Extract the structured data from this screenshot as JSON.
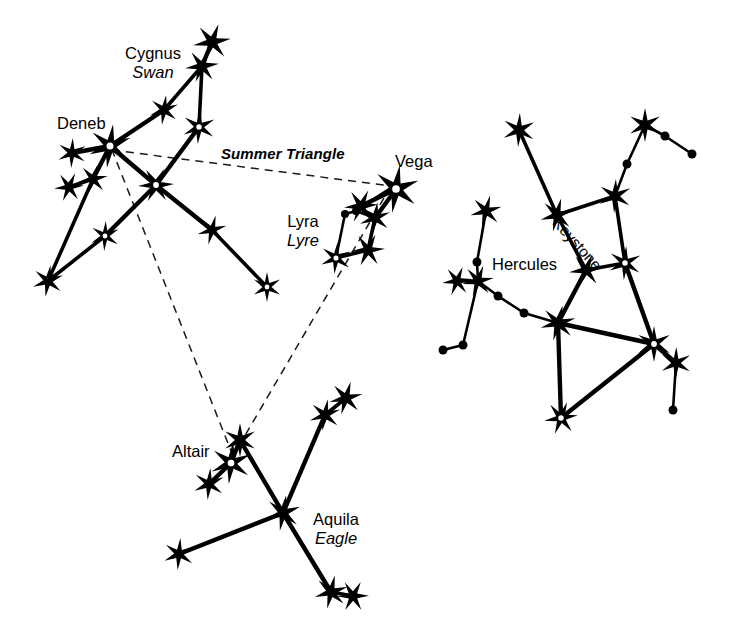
{
  "figure": {
    "background_color": "#ffffff",
    "ink_color": "#000000",
    "width": 735,
    "height": 640
  },
  "labels": {
    "cygnus_name": "Cygnus",
    "cygnus_common": "Swan",
    "deneb": "Deneb",
    "summer_triangle": "Summer Triangle",
    "vega": "Vega",
    "lyra_name": "Lyra",
    "lyra_common": "Lyre",
    "altair": "Altair",
    "aquila_name": "Aquila",
    "aquila_common": "Eagle",
    "hercules": "Hercules",
    "keystone": "Keystone"
  },
  "chart_data": {
    "type": "scatter",
    "xlabel": "",
    "ylabel": "",
    "xlim": [
      0,
      735
    ],
    "ylim": [
      0,
      640
    ],
    "grid": false,
    "legend": "none",
    "marker_types": [
      "star",
      "star-open",
      "dot"
    ],
    "constellations": [
      {
        "name": "Cygnus",
        "common_name": "Swan",
        "label_position": [
          150,
          55
        ],
        "bright_star": "Deneb",
        "stars": [
          {
            "id": "cyg-tip-top",
            "x": 212,
            "y": 42,
            "type": "star",
            "size": 19
          },
          {
            "id": "cyg-tip-2",
            "x": 202,
            "y": 66,
            "type": "star",
            "size": 17
          },
          {
            "id": "cyg-wing-r1",
            "x": 199,
            "y": 127,
            "type": "star-open",
            "size": 17
          },
          {
            "id": "cyg-mid-upper",
            "x": 164,
            "y": 110,
            "type": "star",
            "size": 15
          },
          {
            "id": "deneb",
            "x": 110,
            "y": 146,
            "type": "star-open",
            "size": 22
          },
          {
            "id": "cyg-wing-l1",
            "x": 72,
            "y": 153,
            "type": "star",
            "size": 15
          },
          {
            "id": "cyg-wing-l2",
            "x": 93,
            "y": 179,
            "type": "star",
            "size": 15
          },
          {
            "id": "cyg-wing-l3",
            "x": 69,
            "y": 187,
            "type": "star",
            "size": 15
          },
          {
            "id": "cyg-center",
            "x": 156,
            "y": 185,
            "type": "star-open",
            "size": 18
          },
          {
            "id": "cyg-wing-l4",
            "x": 105,
            "y": 236,
            "type": "star-open",
            "size": 15
          },
          {
            "id": "cyg-wing-l5",
            "x": 48,
            "y": 281,
            "type": "star",
            "size": 16
          },
          {
            "id": "cyg-wing-r2",
            "x": 212,
            "y": 230,
            "type": "star",
            "size": 15
          },
          {
            "id": "cyg-wing-r3",
            "x": 267,
            "y": 287,
            "type": "star-open",
            "size": 15
          }
        ],
        "segments": [
          [
            "cyg-tip-top",
            "cyg-tip-2"
          ],
          [
            "cyg-tip-2",
            "cyg-mid-upper"
          ],
          [
            "cyg-mid-upper",
            "deneb"
          ],
          [
            "cyg-tip-2",
            "cyg-wing-r1"
          ],
          [
            "cyg-wing-r1",
            "cyg-center"
          ],
          [
            "deneb",
            "cyg-wing-l1"
          ],
          [
            "deneb",
            "cyg-wing-l2"
          ],
          [
            "cyg-wing-l2",
            "cyg-wing-l3"
          ],
          [
            "cyg-wing-l2",
            "cyg-wing-l5"
          ],
          [
            "deneb",
            "cyg-center"
          ],
          [
            "cyg-center",
            "cyg-wing-l4"
          ],
          [
            "cyg-wing-l4",
            "cyg-wing-l5"
          ],
          [
            "cyg-center",
            "cyg-wing-r2"
          ],
          [
            "cyg-wing-r2",
            "cyg-wing-r3"
          ]
        ]
      },
      {
        "name": "Lyra",
        "common_name": "Lyre",
        "label_position": [
          292,
          215
        ],
        "bright_star": "Vega",
        "stars": [
          {
            "id": "vega",
            "x": 396,
            "y": 189,
            "type": "star-open",
            "size": 24
          },
          {
            "id": "lyr-n",
            "x": 361,
            "y": 206,
            "type": "star",
            "size": 17
          },
          {
            "id": "lyr-e",
            "x": 375,
            "y": 218,
            "type": "star",
            "size": 16
          },
          {
            "id": "lyr-dot1",
            "x": 345,
            "y": 214,
            "type": "dot",
            "size": 8
          },
          {
            "id": "lyr-dot2",
            "x": 356,
            "y": 211,
            "type": "dot",
            "size": 8
          },
          {
            "id": "lyr-w",
            "x": 336,
            "y": 258,
            "type": "star-open",
            "size": 16
          },
          {
            "id": "lyr-s",
            "x": 368,
            "y": 250,
            "type": "star",
            "size": 17
          }
        ],
        "segments": [
          [
            "vega",
            "lyr-n"
          ],
          [
            "vega",
            "lyr-e"
          ],
          [
            "lyr-e",
            "lyr-dot2"
          ],
          [
            "lyr-dot2",
            "lyr-dot1"
          ],
          [
            "lyr-dot1",
            "lyr-w"
          ],
          [
            "lyr-w",
            "lyr-s"
          ],
          [
            "lyr-s",
            "lyr-e"
          ]
        ]
      },
      {
        "name": "Aquila",
        "common_name": "Eagle",
        "label_position": [
          310,
          512
        ],
        "bright_star": "Altair",
        "stars": [
          {
            "id": "aql-top",
            "x": 240,
            "y": 440,
            "type": "star",
            "size": 17
          },
          {
            "id": "altair",
            "x": 231,
            "y": 463,
            "type": "star-open",
            "size": 21
          },
          {
            "id": "aql-sw",
            "x": 209,
            "y": 484,
            "type": "star",
            "size": 16
          },
          {
            "id": "aql-ne2",
            "x": 346,
            "y": 398,
            "type": "star",
            "size": 17
          },
          {
            "id": "aql-ne1",
            "x": 325,
            "y": 415,
            "type": "star",
            "size": 16
          },
          {
            "id": "aql-hub",
            "x": 283,
            "y": 513,
            "type": "star",
            "size": 18
          },
          {
            "id": "aql-w",
            "x": 179,
            "y": 554,
            "type": "star",
            "size": 16
          },
          {
            "id": "aql-s1",
            "x": 331,
            "y": 592,
            "type": "star",
            "size": 17
          },
          {
            "id": "aql-s2",
            "x": 353,
            "y": 596,
            "type": "star",
            "size": 16
          }
        ],
        "segments": [
          [
            "aql-top",
            "altair"
          ],
          [
            "altair",
            "aql-sw"
          ],
          [
            "aql-top",
            "aql-hub"
          ],
          [
            "aql-ne2",
            "aql-ne1"
          ],
          [
            "aql-ne1",
            "aql-hub"
          ],
          [
            "aql-hub",
            "aql-w"
          ],
          [
            "aql-hub",
            "aql-s1"
          ],
          [
            "aql-s1",
            "aql-s2"
          ]
        ]
      },
      {
        "name": "Hercules",
        "common_name": "",
        "label_position": [
          497,
          266
        ],
        "asterism": "Keystone",
        "stars": [
          {
            "id": "her-nw",
            "x": 519,
            "y": 130,
            "type": "star",
            "size": 17
          },
          {
            "id": "her-ne",
            "x": 645,
            "y": 125,
            "type": "star",
            "size": 17
          },
          {
            "id": "her-dot-a",
            "x": 665,
            "y": 136,
            "type": "dot",
            "size": 9
          },
          {
            "id": "her-dot-b",
            "x": 692,
            "y": 154,
            "type": "dot",
            "size": 9
          },
          {
            "id": "her-dot-c",
            "x": 627,
            "y": 164,
            "type": "dot",
            "size": 9
          },
          {
            "id": "key-nw",
            "x": 557,
            "y": 215,
            "type": "star",
            "size": 17
          },
          {
            "id": "key-ne",
            "x": 615,
            "y": 196,
            "type": "star",
            "size": 17
          },
          {
            "id": "key-se",
            "x": 625,
            "y": 263,
            "type": "star-open",
            "size": 17
          },
          {
            "id": "key-sw",
            "x": 586,
            "y": 270,
            "type": "star",
            "size": 17
          },
          {
            "id": "her-arm-n",
            "x": 486,
            "y": 211,
            "type": "star",
            "size": 16
          },
          {
            "id": "her-dot-d",
            "x": 477,
            "y": 262,
            "type": "dot",
            "size": 9
          },
          {
            "id": "her-arm-j",
            "x": 478,
            "y": 281,
            "type": "star",
            "size": 16
          },
          {
            "id": "her-arm-w",
            "x": 457,
            "y": 281,
            "type": "star",
            "size": 15
          },
          {
            "id": "her-dot-e",
            "x": 498,
            "y": 296,
            "type": "dot",
            "size": 9
          },
          {
            "id": "her-dot-f",
            "x": 524,
            "y": 313,
            "type": "dot",
            "size": 9
          },
          {
            "id": "her-dot-g",
            "x": 463,
            "y": 345,
            "type": "dot",
            "size": 9
          },
          {
            "id": "her-dot-h",
            "x": 443,
            "y": 350,
            "type": "dot",
            "size": 9
          },
          {
            "id": "her-body",
            "x": 558,
            "y": 323,
            "type": "star",
            "size": 18
          },
          {
            "id": "her-e-hub",
            "x": 654,
            "y": 344,
            "type": "star-open",
            "size": 18
          },
          {
            "id": "her-e-leg",
            "x": 676,
            "y": 363,
            "type": "star",
            "size": 16
          },
          {
            "id": "her-dot-i",
            "x": 673,
            "y": 410,
            "type": "dot",
            "size": 9
          },
          {
            "id": "her-s",
            "x": 561,
            "y": 418,
            "type": "star-open",
            "size": 17
          }
        ],
        "segments": [
          [
            "her-nw",
            "key-nw"
          ],
          [
            "her-ne",
            "her-dot-a"
          ],
          [
            "her-dot-a",
            "her-dot-b"
          ],
          [
            "her-ne",
            "her-dot-c"
          ],
          [
            "her-dot-c",
            "key-ne"
          ],
          [
            "key-nw",
            "key-ne"
          ],
          [
            "key-ne",
            "key-se"
          ],
          [
            "key-se",
            "key-sw"
          ],
          [
            "key-sw",
            "key-nw"
          ],
          [
            "key-sw",
            "her-body"
          ],
          [
            "key-se",
            "her-e-hub"
          ],
          [
            "her-arm-n",
            "her-dot-d"
          ],
          [
            "her-dot-d",
            "her-arm-j"
          ],
          [
            "her-arm-j",
            "her-arm-w"
          ],
          [
            "her-arm-j",
            "her-dot-e"
          ],
          [
            "her-dot-e",
            "her-dot-f"
          ],
          [
            "her-dot-f",
            "her-body"
          ],
          [
            "her-arm-j",
            "her-dot-g"
          ],
          [
            "her-dot-g",
            "her-dot-h"
          ],
          [
            "her-body",
            "her-e-hub"
          ],
          [
            "her-body",
            "her-s"
          ],
          [
            "her-s",
            "her-e-hub"
          ],
          [
            "her-e-hub",
            "her-e-leg"
          ],
          [
            "her-e-leg",
            "her-dot-i"
          ]
        ]
      }
    ],
    "asterism": {
      "name": "Summer Triangle",
      "style": "dashed",
      "label_position": [
        222,
        147
      ],
      "vertices": [
        {
          "star": "Deneb",
          "x": 112,
          "y": 150
        },
        {
          "star": "Vega",
          "x": 391,
          "y": 186
        },
        {
          "star": "Altair",
          "x": 233,
          "y": 456
        }
      ]
    }
  }
}
